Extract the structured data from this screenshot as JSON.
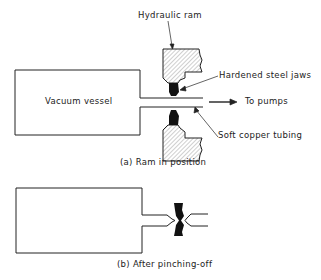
{
  "diagram": {
    "part_a": {
      "labels": {
        "hydraulic_ram": "Hydraulic ram",
        "hardened_jaws": "Hardened steel jaws",
        "vacuum_vessel": "Vacuum vessel",
        "to_pumps": "To pumps",
        "copper_tubing": "Soft copper tubing"
      },
      "caption": "(a) Ram in position"
    },
    "part_b": {
      "caption": "(b) After pinching-off"
    },
    "colors": {
      "line": "#222222",
      "fill_dark": "#111111",
      "hatch": "#888888"
    }
  }
}
